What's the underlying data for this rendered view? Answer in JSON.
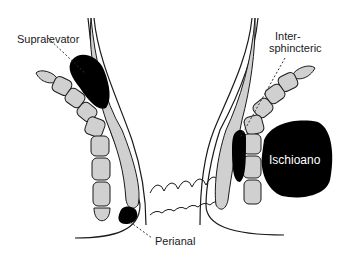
{
  "diagram": {
    "colors": {
      "background": "#ffffff",
      "outline": "#1a1a1a",
      "muscle_fill": "#d0d0d0",
      "abscess_fill": "#000000",
      "leader_line": "#333333"
    },
    "labels": {
      "supralevator": "Supralevator",
      "intersphincteric_line1": "Inter-",
      "intersphincteric_line2": "sphincteric",
      "ischioanal": "Ischioano",
      "perianal": "Perianal"
    }
  }
}
